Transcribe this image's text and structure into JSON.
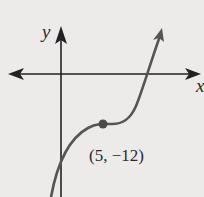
{
  "graph": {
    "x_axis_label": "x",
    "y_axis_label": "y",
    "point_label": "(5, −12)",
    "point": {
      "x": 5,
      "y": -12
    },
    "colors": {
      "background": "#ecebea",
      "axes": "#222222",
      "curve": "#555555",
      "point": "#4a4a4a",
      "text": "#2a2a2a"
    }
  }
}
